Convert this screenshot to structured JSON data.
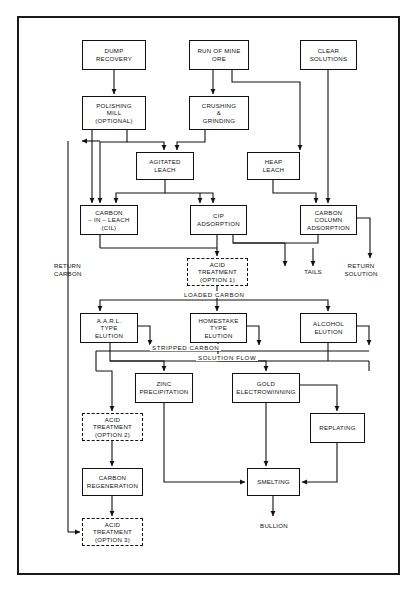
{
  "diagram": {
    "frame_color": "#1a1a1a",
    "line_color": "#111111"
  },
  "nodes": [
    {
      "id": "dump_recovery",
      "label": "DUMP\nRECOVERY",
      "x": 82,
      "y": 40,
      "w": 64,
      "h": 30,
      "style": "solid"
    },
    {
      "id": "run_of_mine_ore",
      "label": "RUN OF MINE\nORE",
      "x": 189,
      "y": 40,
      "w": 60,
      "h": 30,
      "style": "solid"
    },
    {
      "id": "clear_solutions",
      "label": "CLEAR\nSOLUTIONS",
      "x": 300,
      "y": 40,
      "w": 57,
      "h": 30,
      "style": "solid"
    },
    {
      "id": "polishing_mill",
      "label": "POLISHING\nMILL\n(OPTIONAL)",
      "x": 82,
      "y": 96,
      "w": 64,
      "h": 34,
      "style": "solid"
    },
    {
      "id": "crushing_grinding",
      "label": "CRUSHING\n&\nGRINDING",
      "x": 189,
      "y": 96,
      "w": 60,
      "h": 34,
      "style": "solid"
    },
    {
      "id": "agitated_leach",
      "label": "AGITATED\nLEACH",
      "x": 136,
      "y": 152,
      "w": 58,
      "h": 28,
      "style": "solid"
    },
    {
      "id": "heap_leach",
      "label": "HEAP\nLEACH",
      "x": 247,
      "y": 152,
      "w": 53,
      "h": 28,
      "style": "solid"
    },
    {
      "id": "carbon_in_leach",
      "label": "CARBON\n– IN – LEACH\n(CIL)",
      "x": 80,
      "y": 205,
      "w": 58,
      "h": 30,
      "style": "solid"
    },
    {
      "id": "cip_adsorption",
      "label": "CIP\nADSORPTION",
      "x": 190,
      "y": 205,
      "w": 57,
      "h": 30,
      "style": "solid"
    },
    {
      "id": "carbon_column_ads",
      "label": "CARBON\nCOLUMN\nADSORPTION",
      "x": 300,
      "y": 205,
      "w": 57,
      "h": 30,
      "style": "solid"
    },
    {
      "id": "acid_treatment_1",
      "label": "ACID\nTREATMENT\n(OPTION 1)",
      "x": 187,
      "y": 258,
      "w": 61,
      "h": 28,
      "style": "dashed"
    },
    {
      "id": "aarl_type_elution",
      "label": "A.A.R.L.\nTYPE\nELUTION",
      "x": 80,
      "y": 313,
      "w": 58,
      "h": 30,
      "style": "solid"
    },
    {
      "id": "homestake_elution",
      "label": "HOMESTAKE\nTYPE\nELUTION",
      "x": 190,
      "y": 313,
      "w": 57,
      "h": 30,
      "style": "solid"
    },
    {
      "id": "alcohol_elution",
      "label": "ALCOHOL\nELUTION",
      "x": 300,
      "y": 313,
      "w": 57,
      "h": 30,
      "style": "solid"
    },
    {
      "id": "zinc_precipitation",
      "label": "ZINC\nPRECIPITATION",
      "x": 135,
      "y": 373,
      "w": 58,
      "h": 30,
      "style": "solid"
    },
    {
      "id": "gold_electrowinning",
      "label": "GOLD\nELECTROWINNING",
      "x": 232,
      "y": 373,
      "w": 68,
      "h": 30,
      "style": "solid"
    },
    {
      "id": "replating",
      "label": "REPLATING",
      "x": 310,
      "y": 413,
      "w": 55,
      "h": 30,
      "style": "solid"
    },
    {
      "id": "acid_treatment_2",
      "label": "ACID\nTREATMENT\n(OPTION 2)",
      "x": 82,
      "y": 413,
      "w": 61,
      "h": 28,
      "style": "dashed"
    },
    {
      "id": "carbon_regeneration",
      "label": "CARBON\nREGENERATION",
      "x": 82,
      "y": 468,
      "w": 61,
      "h": 28,
      "style": "solid"
    },
    {
      "id": "smelting",
      "label": "SMELTING",
      "x": 247,
      "y": 468,
      "w": 53,
      "h": 28,
      "style": "solid"
    },
    {
      "id": "acid_treatment_3",
      "label": "ACID\nTREATMENT\n(OPTION 3)",
      "x": 82,
      "y": 518,
      "w": 61,
      "h": 28,
      "style": "dashed"
    }
  ],
  "free_labels": [
    {
      "id": "return_carbon",
      "text": "RETURN\nCARBON",
      "x": 54,
      "y": 262,
      "w": 40,
      "align": "left"
    },
    {
      "id": "tails",
      "text": "TAILS",
      "x": 296,
      "y": 268,
      "w": 34,
      "align": "center"
    },
    {
      "id": "return_solution",
      "text": "RETURN\nSOLUTION",
      "x": 338,
      "y": 262,
      "w": 46,
      "align": "center"
    },
    {
      "id": "bullion",
      "text": "BULLION",
      "x": 252,
      "y": 522,
      "w": 44,
      "align": "center"
    }
  ],
  "flow_labels": [
    {
      "id": "loaded_carbon",
      "text": "LOADED  CARBON",
      "x": 182,
      "y": 292
    },
    {
      "id": "stripped_carbon",
      "text": "STRIPPED CARBON",
      "x": 150,
      "y": 347
    },
    {
      "id": "solution_flow",
      "text": "SOLUTION   FLOW",
      "x": 200,
      "y": 357
    }
  ],
  "connections": [
    {
      "from": "dump_recovery",
      "to": "polishing_mill",
      "label": ""
    },
    {
      "from": "run_of_mine_ore",
      "to": "crushing_grinding",
      "label": ""
    },
    {
      "from": "run_of_mine_ore",
      "to": "heap_leach",
      "label": ""
    },
    {
      "from": "clear_solutions",
      "to": "carbon_column_adsorption",
      "label": ""
    },
    {
      "from": "polishing_mill",
      "to": "agitated_leach",
      "label": ""
    },
    {
      "from": "crushing_grinding",
      "to": "agitated_leach",
      "label": ""
    },
    {
      "from": "polishing_mill",
      "to": "carbon_in_leach",
      "label": ""
    },
    {
      "from": "agitated_leach",
      "to": "carbon_in_leach",
      "label": ""
    },
    {
      "from": "agitated_leach",
      "to": "cip_adsorption",
      "label": ""
    },
    {
      "from": "heap_leach",
      "to": "carbon_column_adsorption",
      "label": ""
    },
    {
      "from": "carbon_in_leach",
      "to": "acid_treatment_1",
      "label": "loaded carbon"
    },
    {
      "from": "cip_adsorption",
      "to": "acid_treatment_1",
      "label": "loaded carbon"
    },
    {
      "from": "carbon_column_adsorption",
      "to": "acid_treatment_1",
      "label": "loaded carbon"
    },
    {
      "from": "cip_adsorption",
      "to": "tails",
      "label": ""
    },
    {
      "from": "carbon_column_adsorption",
      "to": "return_solution",
      "label": ""
    },
    {
      "from": "acid_treatment_1",
      "to": "aarl_type_elution",
      "label": ""
    },
    {
      "from": "acid_treatment_1",
      "to": "homestake_elution",
      "label": ""
    },
    {
      "from": "acid_treatment_1",
      "to": "alcohol_elution",
      "label": ""
    },
    {
      "from": "aarl_type_elution",
      "to": "zinc_precipitation",
      "label": "solution flow"
    },
    {
      "from": "homestake_elution",
      "to": "gold_electrowinning",
      "label": "solution flow"
    },
    {
      "from": "alcohol_elution",
      "to": "gold_electrowinning",
      "label": "solution flow"
    },
    {
      "from": "aarl_type_elution",
      "to": "acid_treatment_2",
      "label": "stripped carbon"
    },
    {
      "from": "acid_treatment_2",
      "to": "carbon_regeneration",
      "label": ""
    },
    {
      "from": "carbon_regeneration",
      "to": "acid_treatment_3",
      "label": ""
    },
    {
      "from": "acid_treatment_3",
      "to": "return_carbon",
      "label": ""
    },
    {
      "from": "zinc_precipitation",
      "to": "smelting",
      "label": ""
    },
    {
      "from": "gold_electrowinning",
      "to": "smelting",
      "label": ""
    },
    {
      "from": "gold_electrowinning",
      "to": "replating",
      "label": ""
    },
    {
      "from": "replating",
      "to": "smelting",
      "label": ""
    },
    {
      "from": "smelting",
      "to": "bullion",
      "label": ""
    }
  ]
}
